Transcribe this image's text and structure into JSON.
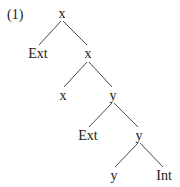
{
  "example_number": "(1)",
  "tree": {
    "nodes": [
      {
        "id": "n0",
        "label": "x",
        "x": 62,
        "y": 14
      },
      {
        "id": "n1",
        "label": "Ext",
        "x": 38,
        "y": 54
      },
      {
        "id": "n2",
        "label": "x",
        "x": 88,
        "y": 54
      },
      {
        "id": "n3",
        "label": "x",
        "x": 63,
        "y": 96
      },
      {
        "id": "n4",
        "label": "y",
        "x": 113,
        "y": 96
      },
      {
        "id": "n5",
        "label": "Ext",
        "x": 88,
        "y": 136
      },
      {
        "id": "n6",
        "label": "y",
        "x": 139,
        "y": 136
      },
      {
        "id": "n7",
        "label": "y",
        "x": 114,
        "y": 176
      },
      {
        "id": "n8",
        "label": "Int",
        "x": 164,
        "y": 176
      }
    ],
    "edges": [
      {
        "from": "n0",
        "to": "n1",
        "x1": 61,
        "y1": 21,
        "x2": 39,
        "y2": 45
      },
      {
        "from": "n0",
        "to": "n2",
        "x1": 63,
        "y1": 21,
        "x2": 87,
        "y2": 45
      },
      {
        "from": "n2",
        "to": "n3",
        "x1": 87,
        "y1": 62,
        "x2": 64,
        "y2": 87
      },
      {
        "from": "n2",
        "to": "n4",
        "x1": 89,
        "y1": 62,
        "x2": 112,
        "y2": 87
      },
      {
        "from": "n4",
        "to": "n5",
        "x1": 112,
        "y1": 103,
        "x2": 89,
        "y2": 127
      },
      {
        "from": "n4",
        "to": "n6",
        "x1": 114,
        "y1": 103,
        "x2": 138,
        "y2": 127
      },
      {
        "from": "n6",
        "to": "n7",
        "x1": 138,
        "y1": 143,
        "x2": 115,
        "y2": 167
      },
      {
        "from": "n6",
        "to": "n8",
        "x1": 140,
        "y1": 143,
        "x2": 163,
        "y2": 167
      }
    ]
  }
}
